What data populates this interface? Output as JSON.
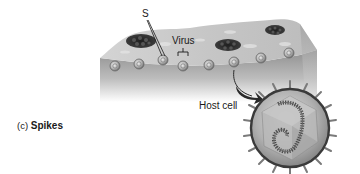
{
  "figure": {
    "panel_label": "(c)",
    "panel_title": "Spikes",
    "labels": {
      "spike": "S",
      "virus": "Virus",
      "host_cell": "Host cell"
    },
    "colors": {
      "background": "#ffffff",
      "block_top": "#c9c9c9",
      "block_front_top": "#9a9a9a",
      "block_front_bottom": "#ffffff",
      "virion_cluster": "#2b2b2b",
      "virion_ring": "#8c8c8c",
      "magnified_shell": "#3a3a3a",
      "magnified_fill": "#a8a8a8",
      "spike": "#7a7a7a",
      "nucleic_acid": "#4a4a4a",
      "arrow": "#2a2a2a",
      "text": "#1a1a1a"
    }
  }
}
